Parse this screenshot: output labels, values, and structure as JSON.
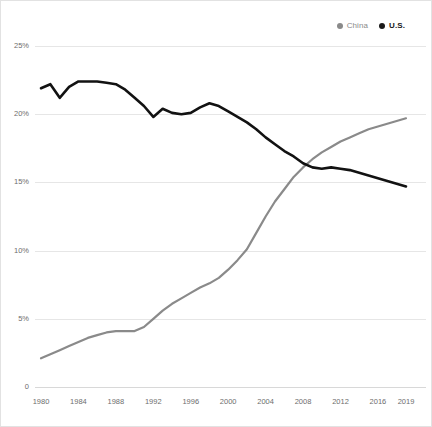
{
  "legend": {
    "position": "top-right",
    "entries": [
      {
        "label": "China",
        "color": "#8a8a8a",
        "marker": "dot-icon"
      },
      {
        "label": "U.S.",
        "color": "#1a1a1a",
        "marker": "dot-icon"
      }
    ]
  },
  "chart_data": {
    "type": "line",
    "title": "",
    "subtitle": "",
    "xlabel": "",
    "ylabel": "",
    "grid": true,
    "legend_position": "top-right",
    "x": [
      1980,
      1981,
      1982,
      1983,
      1984,
      1985,
      1986,
      1987,
      1988,
      1989,
      1990,
      1991,
      1992,
      1993,
      1994,
      1995,
      1996,
      1997,
      1998,
      1999,
      2000,
      2001,
      2002,
      2003,
      2004,
      2005,
      2006,
      2007,
      2008,
      2009,
      2010,
      2011,
      2012,
      2013,
      2014,
      2015,
      2016,
      2017,
      2018,
      2019
    ],
    "xticks": [
      1980,
      1984,
      1988,
      1992,
      1996,
      2000,
      2004,
      2008,
      2012,
      2016,
      2019
    ],
    "xtick_labels": [
      "1980",
      "1984",
      "1988",
      "1992",
      "1996",
      "2000",
      "2004",
      "2008",
      "2012",
      "2016",
      "2019"
    ],
    "yticks": [
      0,
      5,
      10,
      15,
      20,
      25
    ],
    "ytick_labels": [
      "0",
      "5%",
      "10%",
      "15%",
      "20%",
      "25%"
    ],
    "xlim": [
      1980,
      2019
    ],
    "ylim": [
      0,
      25
    ],
    "series": [
      {
        "name": "China",
        "color": "#8a8a8a",
        "width": 2.2,
        "values": [
          2.1,
          2.4,
          2.7,
          3.0,
          3.3,
          3.6,
          3.8,
          4.0,
          4.1,
          4.1,
          4.1,
          4.4,
          5.0,
          5.6,
          6.1,
          6.5,
          6.9,
          7.3,
          7.6,
          8.0,
          8.6,
          9.3,
          10.1,
          11.3,
          12.5,
          13.6,
          14.5,
          15.4,
          16.1,
          16.7,
          17.2,
          17.6,
          18.0,
          18.3,
          18.6,
          18.9,
          19.1,
          19.3,
          19.5,
          19.7
        ]
      },
      {
        "name": "U.S.",
        "color": "#121212",
        "width": 2.6,
        "values": [
          21.9,
          22.2,
          21.2,
          22.0,
          22.4,
          22.4,
          22.4,
          22.3,
          22.2,
          21.8,
          21.2,
          20.6,
          19.8,
          20.4,
          20.1,
          20.0,
          20.1,
          20.5,
          20.8,
          20.6,
          20.2,
          19.8,
          19.4,
          18.9,
          18.3,
          17.8,
          17.3,
          16.9,
          16.4,
          16.1,
          16.0,
          16.1,
          16.0,
          15.9,
          15.7,
          15.5,
          15.3,
          15.1,
          14.9,
          14.7
        ]
      }
    ]
  },
  "plot_geometry": {
    "left": 40,
    "right": 405,
    "top": 45,
    "bottom": 386
  }
}
